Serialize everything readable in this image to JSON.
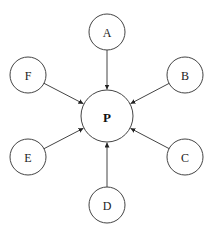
{
  "diagram": {
    "type": "hub-and-spoke",
    "center": {
      "id": "P",
      "label": "P",
      "x": 107,
      "y": 116,
      "r": 26
    },
    "nodes": [
      {
        "id": "A",
        "label": "A",
        "x": 107,
        "y": 32,
        "r": 18
      },
      {
        "id": "B",
        "label": "B",
        "x": 185,
        "y": 75,
        "r": 18
      },
      {
        "id": "C",
        "label": "C",
        "x": 185,
        "y": 157,
        "r": 18
      },
      {
        "id": "D",
        "label": "D",
        "x": 107,
        "y": 205,
        "r": 18
      },
      {
        "id": "E",
        "label": "E",
        "x": 28,
        "y": 157,
        "r": 18
      },
      {
        "id": "F",
        "label": "F",
        "x": 28,
        "y": 75,
        "r": 18
      }
    ],
    "edges": [
      {
        "from": "A",
        "to": "P"
      },
      {
        "from": "B",
        "to": "P"
      },
      {
        "from": "C",
        "to": "P"
      },
      {
        "from": "D",
        "to": "P"
      },
      {
        "from": "E",
        "to": "P"
      },
      {
        "from": "F",
        "to": "P"
      }
    ],
    "colors": {
      "stroke": "#444444",
      "fill": "#ffffff",
      "text": "#222222"
    }
  }
}
